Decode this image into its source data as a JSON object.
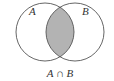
{
  "diagram": {
    "type": "venn",
    "sets": [
      {
        "label": "A",
        "cx": 45,
        "cy": 32,
        "r": 29
      },
      {
        "label": "B",
        "cx": 75,
        "cy": 32,
        "r": 29
      }
    ],
    "shaded_region": "intersection",
    "caption": "A ∩ B",
    "colors": {
      "stroke": "#555555",
      "shade": "#b3b3b3",
      "background": "#ffffff"
    }
  }
}
